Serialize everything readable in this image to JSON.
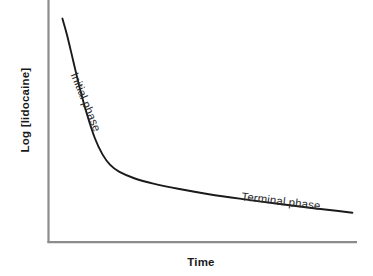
{
  "chart_data": {
    "type": "line",
    "title": "",
    "subtitle": "",
    "xlabel": "Time",
    "ylabel": "Log [lidocaine]",
    "grid": false,
    "legend": false,
    "legend_position": "none",
    "axis_ticks": false,
    "tick_labels": [],
    "xlim": [
      0,
      1
    ],
    "ylim": [
      0,
      1
    ],
    "background_color": "#ffffff",
    "axis_color": "#8c8c8c",
    "curve_color": "#1a1a1a",
    "text_color": "#1a1a1a",
    "series": [
      {
        "name": "Log [lidocaine] decay",
        "color": "#1a1a1a",
        "x": [
          0.045,
          0.06,
          0.08,
          0.1,
          0.125,
          0.15,
          0.175,
          0.2,
          0.23,
          0.28,
          0.34,
          0.42,
          0.52,
          0.63,
          0.75,
          0.86,
          0.94,
          0.985
        ],
        "y": [
          0.955,
          0.885,
          0.775,
          0.665,
          0.545,
          0.445,
          0.375,
          0.33,
          0.3,
          0.272,
          0.25,
          0.228,
          0.205,
          0.184,
          0.163,
          0.145,
          0.133,
          0.126
        ]
      }
    ],
    "annotations": [
      {
        "id": "initial-phase",
        "text": "Initial phase",
        "rotation_deg": 68,
        "x": 0.12,
        "y": 0.6
      },
      {
        "id": "terminal-phase",
        "text": "Terminal phase",
        "rotation_deg": 7,
        "x": 0.755,
        "y": 0.175
      }
    ]
  },
  "axes": {
    "y_title": "Log [lidocaine]",
    "x_title": "Time"
  },
  "annotations": {
    "initial_phase": "Initial phase",
    "terminal_phase": "Terminal phase"
  }
}
